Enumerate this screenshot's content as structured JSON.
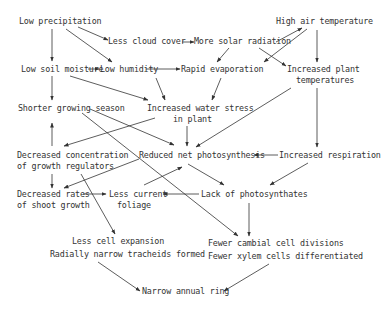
{
  "diagram": {
    "nodes": [
      {
        "id": "low_precip",
        "label": "Low precipitation"
      },
      {
        "id": "less_cloud",
        "label": "Less cloud cover"
      },
      {
        "id": "more_solar",
        "label": "More solar radiation"
      },
      {
        "id": "high_air_temp",
        "label": "High air temperature"
      },
      {
        "id": "low_soil",
        "label": "Low soil moisture"
      },
      {
        "id": "low_humidity",
        "label": "Low humidity"
      },
      {
        "id": "rapid_evap",
        "label": "Rapid evaporation"
      },
      {
        "id": "inc_plant_temp_1",
        "label": "Increased plant"
      },
      {
        "id": "inc_plant_temp_2",
        "label": "temperatures"
      },
      {
        "id": "shorter_season",
        "label": "Shorter growing season"
      },
      {
        "id": "inc_water_stress_1",
        "label": "Increased water stress"
      },
      {
        "id": "inc_water_stress_2",
        "label": "in plant"
      },
      {
        "id": "dec_conc_1",
        "label": "Decreased concentration"
      },
      {
        "id": "dec_conc_2",
        "label": "of growth regulators"
      },
      {
        "id": "reduced_photo",
        "label": "Reduced net photosynthesis"
      },
      {
        "id": "inc_resp",
        "label": "Increased respiration"
      },
      {
        "id": "dec_rates_1",
        "label": "Decreased rates"
      },
      {
        "id": "dec_rates_2",
        "label": "of shoot growth"
      },
      {
        "id": "less_foliage_1",
        "label": "Less current"
      },
      {
        "id": "less_foliage_2",
        "label": "foliage"
      },
      {
        "id": "lack_photo",
        "label": "Lack of photosynthates"
      },
      {
        "id": "less_cell_exp_1",
        "label": "Less cell expansion"
      },
      {
        "id": "less_cell_exp_2",
        "label": "Radially narrow tracheids formed"
      },
      {
        "id": "fewer_cambial_1",
        "label": "Fewer cambial cell divisions"
      },
      {
        "id": "fewer_cambial_2",
        "label": "Fewer xylem cells differentiated"
      },
      {
        "id": "narrow_ring",
        "label": "Narrow annual ring"
      }
    ],
    "edges": [
      {
        "from": "Low precipitation",
        "to": "Less cloud cover"
      },
      {
        "from": "Low precipitation",
        "to": "Low soil moisture"
      },
      {
        "from": "Low precipitation",
        "to": "Low humidity"
      },
      {
        "from": "Less cloud cover",
        "to": "More solar radiation"
      },
      {
        "from": "More solar radiation",
        "to": "High air temperature"
      },
      {
        "from": "More solar radiation",
        "to": "Rapid evaporation"
      },
      {
        "from": "More solar radiation",
        "to": "Increased plant temperatures"
      },
      {
        "from": "High air temperature",
        "to": "Rapid evaporation"
      },
      {
        "from": "High air temperature",
        "to": "Increased plant temperatures"
      },
      {
        "from": "Low soil moisture",
        "to": "Low humidity"
      },
      {
        "from": "Low soil moisture",
        "to": "Shorter growing season"
      },
      {
        "from": "Low soil moisture",
        "to": "Increased water stress in plant"
      },
      {
        "from": "Low humidity",
        "to": "Rapid evaporation"
      },
      {
        "from": "Low humidity",
        "to": "Increased water stress in plant"
      },
      {
        "from": "Rapid evaporation",
        "to": "Increased water stress in plant"
      },
      {
        "from": "Increased plant temperatures",
        "to": "Reduced net photosynthesis"
      },
      {
        "from": "Increased plant temperatures",
        "to": "Increased respiration"
      },
      {
        "from": "Increased water stress in plant",
        "to": "Reduced net photosynthesis"
      },
      {
        "from": "Increased water stress in plant",
        "to": "Decreased concentration of growth regulators"
      },
      {
        "from": "Shorter growing season",
        "to": "Reduced net photosynthesis"
      },
      {
        "from": "Shorter growing season",
        "to": "Fewer cambial cell divisions"
      },
      {
        "from": "Decreased concentration of growth regulators",
        "to": "Shorter growing season"
      },
      {
        "from": "Decreased concentration of growth regulators",
        "to": "Decreased rates of shoot growth"
      },
      {
        "from": "Decreased concentration of growth regulators",
        "to": "Less cell expansion"
      },
      {
        "from": "Reduced net photosynthesis",
        "to": "Decreased rates of shoot growth"
      },
      {
        "from": "Reduced net photosynthesis",
        "to": "Lack of photosynthates"
      },
      {
        "from": "Increased respiration",
        "to": "Reduced net photosynthesis"
      },
      {
        "from": "Increased respiration",
        "to": "Lack of photosynthates"
      },
      {
        "from": "Decreased rates of shoot growth",
        "to": "Less current foliage"
      },
      {
        "from": "Less current foliage",
        "to": "Reduced net photosynthesis"
      },
      {
        "from": "Lack of photosynthates",
        "to": "Less current foliage"
      },
      {
        "from": "Lack of photosynthates",
        "to": "Fewer cambial cell divisions"
      },
      {
        "from": "Less cell expansion",
        "to": "Narrow annual ring"
      },
      {
        "from": "Fewer cambial cell divisions",
        "to": "Narrow annual ring"
      }
    ]
  }
}
